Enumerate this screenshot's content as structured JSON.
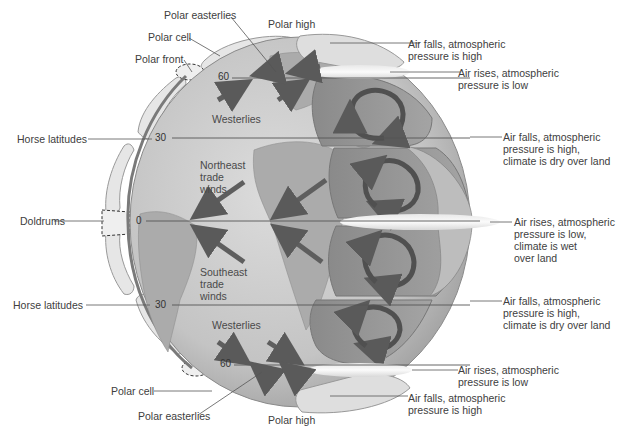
{
  "diagram": {
    "colors": {
      "globe": "#c9c9c9",
      "globe_edge": "#9a9a9a",
      "land": "#a9a9a9",
      "cell_light": "#e4e4e4",
      "cell_dark": "#8f8f8f",
      "arrow": "#5e5e5e",
      "cloud": "#f2f2f2",
      "leader_line": "#555555"
    },
    "left_labels": {
      "polar_easterlies_top": "Polar easterlies",
      "polar_high_top": "Polar high",
      "polar_cell_top": "Polar cell",
      "polar_front": "Polar front",
      "horse_latitudes_north": "Horse latitudes",
      "doldrums": "Doldrums",
      "horse_latitudes_south": "Horse latitudes",
      "polar_cell_bottom": "Polar cell",
      "polar_easterlies_bottom": "Polar easterlies",
      "polar_high_bottom": "Polar high"
    },
    "inner_labels": {
      "westerlies_north": "Westerlies",
      "northeast_trade_winds": "Northeast\ntrade\nwinds",
      "southeast_trade_winds": "Southeast\ntrade\nwinds",
      "westerlies_south": "Westerlies"
    },
    "latitudes": {
      "n60": "60",
      "n30": "30",
      "eq": "0",
      "s30": "30",
      "s60": "60"
    },
    "right_labels": [
      {
        "text": "Air falls, atmospheric\npressure is high"
      },
      {
        "text": "Air rises, atmospheric\npressure is low"
      },
      {
        "text": "Air falls, atmospheric\npressure is high,\nclimate is dry over land"
      },
      {
        "text": "Air rises, atmospheric\npressure is low,\nclimate is wet\nover land"
      },
      {
        "text": "Air falls, atmospheric\npressure is high,\nclimate is dry over land"
      },
      {
        "text": "Air rises, atmospheric\npressure is low"
      },
      {
        "text": "Air falls, atmospheric\npressure is high"
      }
    ]
  }
}
